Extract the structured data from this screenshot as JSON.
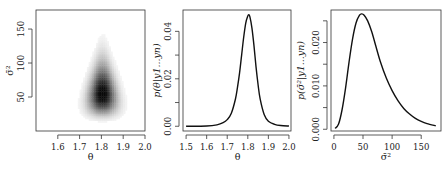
{
  "chart_data": [
    {
      "type": "heatmap",
      "title": "",
      "xlabel": "θ",
      "ylabel": "σ̄²",
      "xlim": [
        1.5,
        2.0
      ],
      "ylim": [
        0,
        178
      ],
      "xticks": [
        "1.6",
        "1.7",
        "1.8",
        "1.9",
        "2.0"
      ],
      "xtick_values": [
        1.6,
        1.7,
        1.8,
        1.9,
        2.0
      ],
      "yticks": [
        "50",
        "100",
        "150"
      ],
      "ytick_values": [
        50,
        100,
        150
      ],
      "density": {
        "mode": [
          1.805,
          55
        ],
        "theta_sd_at_base": 0.045,
        "sigma2_low": 15,
        "sigma2_high": 140,
        "description": "Grayscale joint posterior density, teardrop shape widest near σ̄²≈40, narrowing upward to σ̄²≈135"
      },
      "grid": false
    },
    {
      "type": "line",
      "title": "",
      "xlabel": "θ",
      "ylabel": "p(θ|y1...yn)",
      "xlim": [
        1.485,
        2.01
      ],
      "ylim": [
        -0.002,
        0.049
      ],
      "xticks": [
        "1.5",
        "1.6",
        "1.7",
        "1.8",
        "1.9",
        "2.0"
      ],
      "xtick_values": [
        1.5,
        1.6,
        1.7,
        1.8,
        1.9,
        2.0
      ],
      "yticks": [
        "0.00",
        "",
        "0.02",
        "",
        "0.04"
      ],
      "ytick_values": [
        0.0,
        0.01,
        0.02,
        0.03,
        0.04
      ],
      "series": [
        {
          "name": "posterior theta",
          "x": [
            1.5,
            1.6,
            1.65,
            1.68,
            1.7,
            1.72,
            1.74,
            1.75,
            1.76,
            1.77,
            1.78,
            1.79,
            1.8,
            1.805,
            1.81,
            1.82,
            1.83,
            1.84,
            1.85,
            1.86,
            1.88,
            1.9,
            1.93,
            1.96,
            2.0
          ],
          "y": [
            0.0,
            0.0001,
            0.0006,
            0.0015,
            0.0028,
            0.0055,
            0.0115,
            0.0165,
            0.0225,
            0.03,
            0.0375,
            0.0435,
            0.0465,
            0.047,
            0.0462,
            0.0415,
            0.034,
            0.025,
            0.0175,
            0.0115,
            0.0048,
            0.0021,
            0.0008,
            0.0003,
            0.0001
          ]
        }
      ],
      "grid": false
    },
    {
      "type": "line",
      "title": "",
      "xlabel": "σ̄²",
      "ylabel": "p(σ̄²|y1...yn)",
      "xlim": [
        -5,
        184
      ],
      "ylim": [
        -0.0004,
        0.0275
      ],
      "xticks": [
        "0",
        "50",
        "100",
        "150"
      ],
      "xtick_values": [
        0,
        50,
        100,
        150
      ],
      "yticks": [
        "0.000",
        "",
        "0.010",
        "",
        "0.020",
        ""
      ],
      "ytick_values": [
        0.0,
        0.005,
        0.01,
        0.015,
        0.02,
        0.025
      ],
      "series": [
        {
          "name": "posterior sigma2",
          "x": [
            2,
            8,
            14,
            20,
            26,
            32,
            38,
            44,
            48,
            52,
            58,
            65,
            72,
            80,
            90,
            100,
            110,
            120,
            130,
            140,
            150,
            160,
            175
          ],
          "y": [
            0.0002,
            0.0012,
            0.0045,
            0.0095,
            0.0155,
            0.0208,
            0.0245,
            0.0263,
            0.0266,
            0.0263,
            0.025,
            0.0225,
            0.0192,
            0.0155,
            0.0118,
            0.0089,
            0.0066,
            0.0048,
            0.0035,
            0.0025,
            0.0018,
            0.0013,
            0.0008
          ]
        }
      ],
      "grid": false
    }
  ]
}
